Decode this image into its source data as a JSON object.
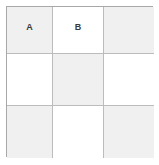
{
  "diagram": {
    "rows": 3,
    "columns": 3,
    "colors": {
      "shaded_cell": "#f0f0f0",
      "empty_cell": "#ffffff",
      "outer_border": "#a8a8a8",
      "inner_grid_line": "#bcbcbc",
      "label_text": "#3a3a3a",
      "background": "#ffffff"
    },
    "cells": [
      {
        "row": 1,
        "col": 1,
        "label": "A",
        "shaded": true
      },
      {
        "row": 1,
        "col": 2,
        "label": "B",
        "shaded": false
      },
      {
        "row": 1,
        "col": 3,
        "label": "",
        "shaded": true
      },
      {
        "row": 2,
        "col": 1,
        "label": "",
        "shaded": false
      },
      {
        "row": 2,
        "col": 2,
        "label": "",
        "shaded": true
      },
      {
        "row": 2,
        "col": 3,
        "label": "",
        "shaded": false
      },
      {
        "row": 3,
        "col": 1,
        "label": "",
        "shaded": true
      },
      {
        "row": 3,
        "col": 2,
        "label": "",
        "shaded": false
      },
      {
        "row": 3,
        "col": 3,
        "label": "",
        "shaded": true
      }
    ]
  }
}
